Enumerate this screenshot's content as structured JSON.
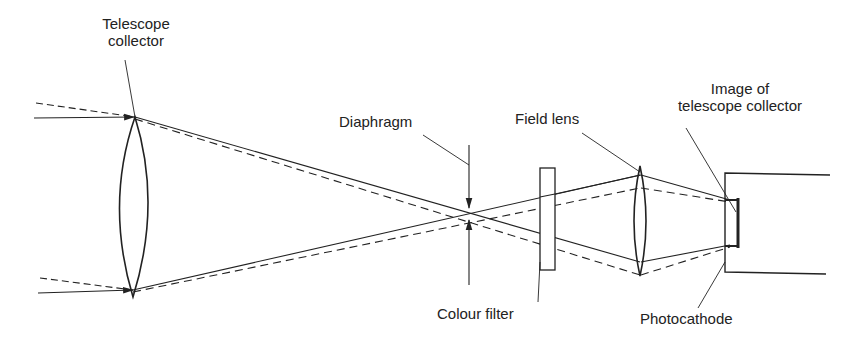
{
  "labels": {
    "telescope_collector_1": "Telescope",
    "telescope_collector_2": "collector",
    "diaphragm": "Diaphragm",
    "field_lens": "Field lens",
    "image_of_1": "Image of",
    "image_of_2": "telescope collector",
    "colour_filter": "Colour filter",
    "photocathode": "Photocathode"
  },
  "colors": {
    "ink": "#222222",
    "background": "#ffffff"
  }
}
